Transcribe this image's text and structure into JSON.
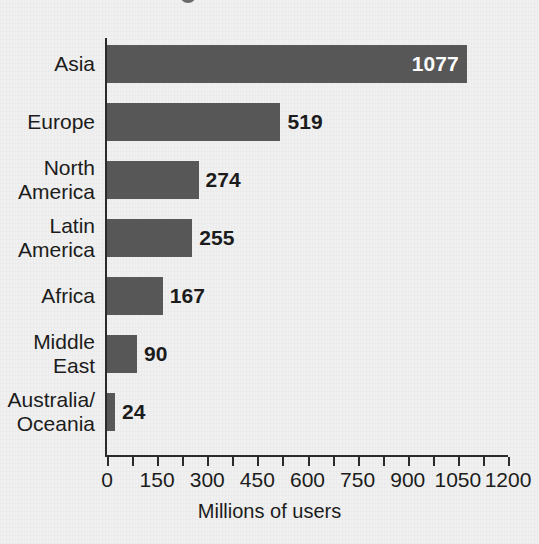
{
  "chart_data": {
    "type": "bar",
    "orientation": "horizontal",
    "title": "",
    "xlabel": "Millions of users",
    "ylabel": "",
    "categories": [
      "Asia",
      "Europe",
      "North America",
      "Latin America",
      "Africa",
      "Middle East",
      "Australia/Oceania"
    ],
    "category_lines": [
      [
        "Asia"
      ],
      [
        "Europe"
      ],
      [
        "North",
        "America"
      ],
      [
        "Latin",
        "America"
      ],
      [
        "Africa"
      ],
      [
        "Middle",
        "East"
      ],
      [
        "Australia/",
        "Oceania"
      ]
    ],
    "values": [
      1077,
      519,
      274,
      255,
      167,
      90,
      24
    ],
    "value_labels": [
      "1077",
      "519",
      "274",
      "255",
      "167",
      "90",
      "24"
    ],
    "xlim": [
      0,
      1200
    ],
    "xticks": [
      0,
      150,
      300,
      450,
      600,
      750,
      900,
      1050,
      1200
    ],
    "xtick_labels": [
      "0",
      "150",
      "300",
      "450",
      "600",
      "750",
      "900",
      "1050",
      "1200"
    ],
    "minor_tick_step": 75,
    "grid": false,
    "legend": null,
    "bar_color": "#585858",
    "background_color": "#f0f0f0",
    "axis_color": "#2b2b2b",
    "label_color": "#1c1c1c",
    "value_label_inside_color": "#ffffff"
  },
  "axis": {
    "x_title": "Millions of users"
  }
}
